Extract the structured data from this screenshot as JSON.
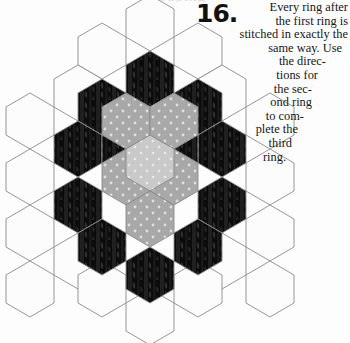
{
  "page": {
    "background_color": "#fdfdfd",
    "width": 350,
    "height": 343,
    "cut_off_top_text": "grouping"
  },
  "instruction": {
    "number": "16.",
    "full_text": "Every ring after the first ring is stitched in exactly the same way. Use the directions for the second ring to complete the third ring.",
    "lines": [
      "Every ring after",
      "the first ring is",
      "stitched in exactly the",
      "same way. Use",
      "the direc-",
      "tions for",
      "the sec-",
      "ond ring",
      "to com-",
      "plete the",
      "third",
      "ring."
    ]
  },
  "diagram": {
    "name": "hexagon-rosette",
    "hex_width": 48,
    "hex_height": 55,
    "center": {
      "x": 150,
      "y": 172
    },
    "rings": [
      {
        "index": 0,
        "label": "center",
        "count": 1,
        "fabric": "light-gray-dot",
        "color": "#c9c9c9"
      },
      {
        "index": 1,
        "label": "first ring",
        "count": 6,
        "fabric": "medium-gray-dot",
        "color": "#a8a8a8"
      },
      {
        "index": 2,
        "label": "second ring",
        "count": 12,
        "fabric": "dark-print",
        "color": "#101010"
      },
      {
        "index": 3,
        "label": "third ring",
        "count": 18,
        "fabric": "white-solid",
        "color": "#fbfbfb"
      }
    ],
    "colors": {
      "center_fill": "#c9c9c9",
      "ring1_fill": "#a8a8a8",
      "ring2_fill": "#0d0d0d",
      "ring2_stripe": "#242424",
      "ring3_fill": "#fcfcfc",
      "outline": "#8a8a8a",
      "dot": "#eaeaea"
    }
  }
}
